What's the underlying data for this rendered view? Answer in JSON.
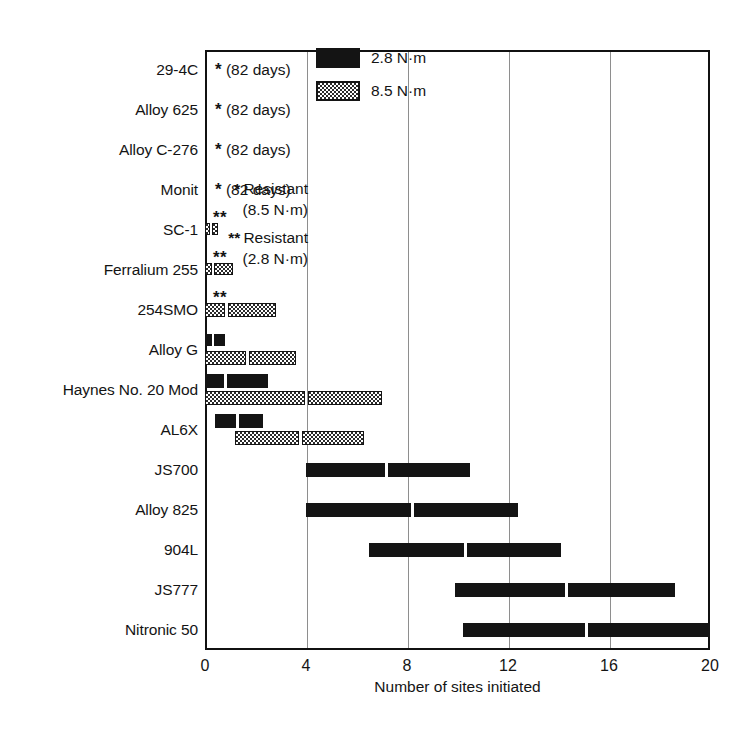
{
  "chart_data": {
    "type": "bar",
    "title": "",
    "xlabel": "Number of sites initiated",
    "ylabel": "",
    "xlim": [
      0,
      20
    ],
    "xticks": [
      0,
      4,
      8,
      12,
      16,
      20
    ],
    "grid": "vertical",
    "orientation": "horizontal",
    "bar_style": "floating range bars split into two sub-segments",
    "legend": {
      "position": "top-right inside plot",
      "entries": [
        {
          "name": "2.8 N·m",
          "swatch": "solid-black"
        },
        {
          "name": "8.5 N·m",
          "swatch": "stippled"
        }
      ]
    },
    "annotations": {
      "resistant_key": [
        {
          "mark": "*",
          "text": "Resistant",
          "sub": "(8.5 N·m)"
        },
        {
          "mark": "**",
          "text": "Resistant",
          "sub": "(2.8 N·m)"
        }
      ],
      "exposure_note": "(82 days)"
    },
    "categories": [
      "29-4C",
      "Alloy 625",
      "Alloy C-276",
      "Monit",
      "SC-1",
      "Ferralium 255",
      "254SMO",
      "Alloy G",
      "Haynes No. 20 Mod",
      "AL6X",
      "JS700",
      "Alloy 825",
      "904L",
      "JS777",
      "Nitronic 50"
    ],
    "series": [
      {
        "name": "2.8 N·m",
        "style": "solid",
        "values": [
          null,
          null,
          null,
          null,
          null,
          null,
          null,
          {
            "start": 0.0,
            "mid": 0.3,
            "end": 0.8
          },
          {
            "start": 0.0,
            "mid": 0.8,
            "end": 2.5
          },
          {
            "start": 0.4,
            "mid": 1.3,
            "end": 2.3
          },
          {
            "start": 4.0,
            "mid": 7.2,
            "end": 10.5
          },
          {
            "start": 4.0,
            "mid": 8.2,
            "end": 12.4
          },
          {
            "start": 6.5,
            "mid": 10.3,
            "end": 14.1
          },
          {
            "start": 9.9,
            "mid": 14.3,
            "end": 18.6
          },
          {
            "start": 10.2,
            "mid": 15.1,
            "end": 20.0
          }
        ]
      },
      {
        "name": "8.5 N·m",
        "style": "stipple",
        "values": [
          null,
          null,
          null,
          null,
          {
            "start": 0.0,
            "mid": 0.22,
            "end": 0.5
          },
          {
            "start": 0.0,
            "mid": 0.32,
            "end": 1.1
          },
          {
            "start": 0.0,
            "mid": 0.85,
            "end": 2.8
          },
          {
            "start": 0.0,
            "mid": 1.7,
            "end": 3.6
          },
          {
            "start": 0.0,
            "mid": 4.0,
            "end": 7.0
          },
          {
            "start": 1.2,
            "mid": 3.8,
            "end": 6.3
          },
          null,
          null,
          null,
          null,
          null
        ]
      }
    ],
    "row_notes": [
      {
        "category": "29-4C",
        "mark": "*",
        "text": "(82 days)"
      },
      {
        "category": "Alloy 625",
        "mark": "*",
        "text": "(82 days)"
      },
      {
        "category": "Alloy C-276",
        "mark": "*",
        "text": "(82 days)"
      },
      {
        "category": "Monit",
        "mark": "*",
        "text": "(82 days)"
      },
      {
        "category": "SC-1",
        "mark": "**",
        "text": ""
      },
      {
        "category": "Ferralium 255",
        "mark": "**",
        "text": ""
      },
      {
        "category": "254SMO",
        "mark": "**",
        "text": ""
      }
    ]
  },
  "colors": {
    "ink": "#141414",
    "grid": "#8e8e8e",
    "frame": "#111111",
    "paper": "#ffffff"
  }
}
